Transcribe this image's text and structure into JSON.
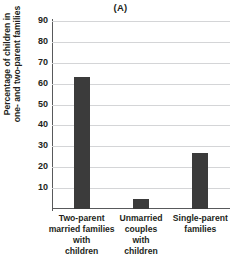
{
  "chart_data": {
    "type": "bar",
    "title": "(A)",
    "xlabel": "",
    "ylabel": "Percentage of children in one- and two-parent families",
    "ylabel_lines": [
      "Percentage of children in",
      "one- and two-parent families"
    ],
    "categories": [
      "Two-parent married families with children",
      "Unmarried couples with children",
      "Single-parent families"
    ],
    "category_lines": [
      [
        "Two-parent",
        "married families",
        "with",
        "children"
      ],
      [
        "Unmarried",
        "couples",
        "with",
        "children"
      ],
      [
        "Single-parent",
        "families"
      ]
    ],
    "values": [
      63,
      5,
      27
    ],
    "ylim": [
      0,
      90
    ],
    "yticks": [
      10,
      20,
      30,
      40,
      50,
      60,
      70,
      80,
      90
    ],
    "ytick_labels": [
      "10",
      "20",
      "30",
      "40",
      "50",
      "60",
      "70",
      "80",
      "90"
    ],
    "grid": true,
    "legend": false,
    "legend_position": "none",
    "bar_color": "#3b3b3b",
    "gridline_color": "#d4d5d7",
    "axis_color": "#58595b",
    "text_color": "#231f20",
    "background_color": "#ffffff"
  }
}
